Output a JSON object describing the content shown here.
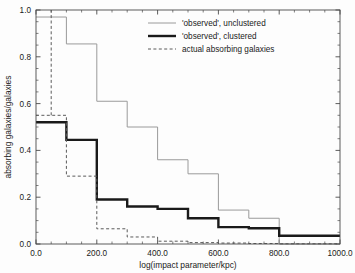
{
  "chart_data": {
    "type": "line",
    "subtype": "step-histogram",
    "title": "",
    "xlabel": "log(impact parameter/kpc)",
    "ylabel": "absorbing galaxies/galaxies",
    "xlim": [
      0,
      1000
    ],
    "ylim": [
      0.0,
      1.0
    ],
    "xticks": [
      0,
      200,
      400,
      600,
      800,
      1000
    ],
    "xtick_labels": [
      "0.0",
      "200.0",
      "400.0",
      "600.0",
      "800.0",
      "1000.0"
    ],
    "yticks": [
      0.0,
      0.2,
      0.4,
      0.6,
      0.8,
      1.0
    ],
    "ytick_labels": [
      "0.0",
      "0.2",
      "0.4",
      "0.6",
      "0.8",
      "1.0"
    ],
    "xminor_interval": 50,
    "yminor_interval": 0.05,
    "grid": false,
    "legend_position": "top-center",
    "bin_edges": [
      0,
      100,
      200,
      300,
      400,
      500,
      600,
      700,
      800,
      900,
      1000
    ],
    "series": [
      {
        "name": "'observed', unclustered",
        "style": "thin-solid",
        "color": "#9a9a9a",
        "linewidth": 1.0,
        "values": [
          0.97,
          0.855,
          0.61,
          0.5,
          0.36,
          0.3,
          0.145,
          0.11,
          0.0,
          0.0
        ]
      },
      {
        "name": "'observed', clustered",
        "style": "thick-solid",
        "color": "#1a1a1a",
        "linewidth": 2.4,
        "values": [
          0.52,
          0.445,
          0.19,
          0.16,
          0.15,
          0.11,
          0.072,
          0.067,
          0.035,
          0.035
        ]
      },
      {
        "name": "actual absorbing galaxies",
        "style": "dashed",
        "color": "#5a5a5a",
        "linewidth": 1.0,
        "values": [
          0.55,
          0.29,
          0.065,
          0.03,
          0.012,
          0.006,
          0.004,
          0.002,
          0.001,
          0.001
        ],
        "leading_edge_value": 1.0,
        "leading_edge_x": 50
      }
    ],
    "legend_entries": [
      {
        "label": "'observed', unclustered",
        "style": "thin-solid",
        "color": "#9a9a9a"
      },
      {
        "label": "'observed', clustered",
        "style": "thick-solid",
        "color": "#1a1a1a"
      },
      {
        "label": "actual absorbing galaxies",
        "style": "dashed",
        "color": "#5a5a5a"
      }
    ]
  },
  "colors": {
    "background": "#fdfdfd",
    "axis": "#4a4a4a",
    "text": "#1a1a1a",
    "unclustered": "#9a9a9a",
    "clustered": "#1a1a1a",
    "actual": "#5a5a5a"
  }
}
